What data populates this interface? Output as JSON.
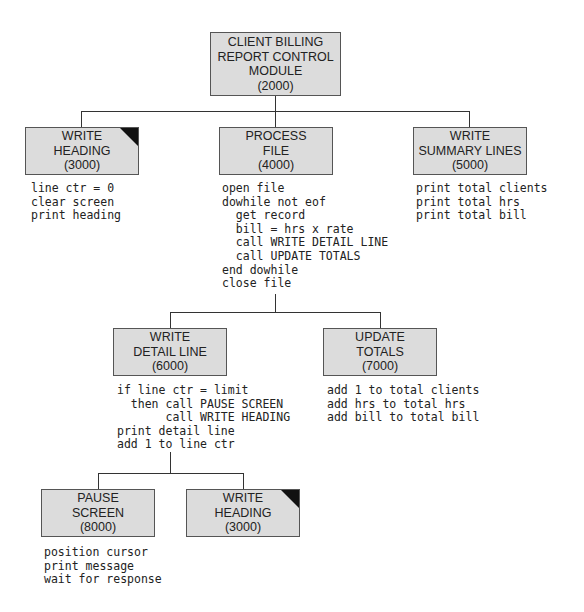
{
  "diagram": {
    "type": "structure-chart",
    "colors": {
      "box_fill": "#dcdcdc",
      "box_border": "#555555",
      "line": "#333333",
      "corner_marker": "#111111",
      "text": "#222222"
    },
    "modules": {
      "control": {
        "lines": [
          "CLIENT BILLING",
          "REPORT CONTROL",
          "MODULE",
          "(2000)"
        ],
        "repeated_marker": false
      },
      "write_heading": {
        "lines": [
          "WRITE",
          "HEADING",
          "(3000)"
        ],
        "repeated_marker": true,
        "pseudocode": [
          "line ctr = 0",
          "clear screen",
          "print heading"
        ]
      },
      "process_file": {
        "lines": [
          "PROCESS",
          "FILE",
          "(4000)"
        ],
        "repeated_marker": false,
        "pseudocode": [
          "open file",
          "dowhile not eof",
          "  get record",
          "  bill = hrs x rate",
          "  call WRITE DETAIL LINE",
          "  call UPDATE TOTALS",
          "end dowhile",
          "close file"
        ]
      },
      "write_summary_lines": {
        "lines": [
          "WRITE",
          "SUMMARY LINES",
          "(5000)"
        ],
        "repeated_marker": false,
        "pseudocode": [
          "print total clients",
          "print total hrs",
          "print total bill"
        ]
      },
      "write_detail_line": {
        "lines": [
          "WRITE",
          "DETAIL LINE",
          "(6000)"
        ],
        "repeated_marker": false,
        "pseudocode": [
          "if line ctr = limit",
          "  then call PAUSE SCREEN",
          "       call WRITE HEADING",
          "print detail line",
          "add 1 to line ctr"
        ]
      },
      "update_totals": {
        "lines": [
          "UPDATE",
          "TOTALS",
          "(7000)"
        ],
        "repeated_marker": false,
        "pseudocode": [
          "add 1 to total clients",
          "add hrs to total hrs",
          "add bill to total bill"
        ]
      },
      "pause_screen": {
        "lines": [
          "PAUSE",
          "SCREEN",
          "(8000)"
        ],
        "repeated_marker": false,
        "pseudocode": [
          "position cursor",
          "print message",
          "wait for response"
        ]
      },
      "write_heading_repeat": {
        "lines": [
          "WRITE",
          "HEADING",
          "(3000)"
        ],
        "repeated_marker": true
      }
    }
  }
}
